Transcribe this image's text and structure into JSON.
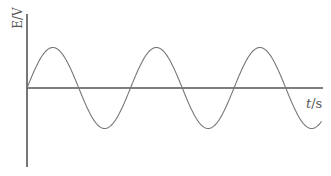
{
  "chart_data": {
    "type": "line",
    "title": "",
    "xlabel": "t/s",
    "ylabel": "E/V",
    "grid": false,
    "legend": null,
    "series": [
      {
        "name": "E",
        "function": "sine",
        "amplitude_relative": 1,
        "starts_at": "zero, rising",
        "periods_shown": 2.85
      }
    ],
    "xticks": [],
    "yticks": []
  },
  "labels": {
    "y_axis": "E/V",
    "x_axis_italic": "t",
    "x_axis_unit": "/s"
  },
  "colors": {
    "axis": "#555555",
    "curve": "#777777",
    "text": "#555555"
  }
}
